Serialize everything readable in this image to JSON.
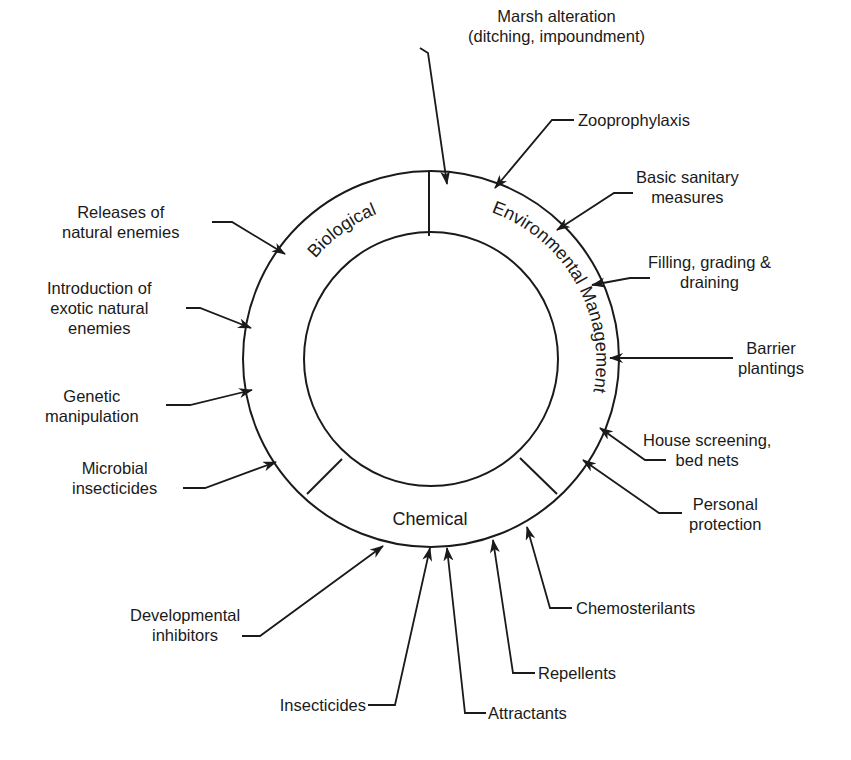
{
  "diagram": {
    "colors": {
      "ink": "#1a1a1a",
      "background": "#ffffff"
    },
    "segments": {
      "biological": "Biological",
      "environmental": "Environmental Management",
      "chemical": "Chemical"
    },
    "labels": {
      "marsh": "Marsh alteration\n(ditching, impoundment)",
      "zoo": "Zooprophylaxis",
      "sanitary": "Basic sanitary\nmeasures",
      "filling": "Filling, grading &\ndraining",
      "barrier": "Barrier\nplantings",
      "house": "House screening,\nbed nets",
      "personal": "Personal\nprotection",
      "chemoster": "Chemosterilants",
      "repellents": "Repellents",
      "attractants": "Attractants",
      "insecticides": "Insecticides",
      "developmental": "Developmental\ninhibitors",
      "microbial": "Microbial\ninsecticides",
      "genetic": "Genetic\nmanipulation",
      "introduction": "Introduction of\nexotic natural\nenemies",
      "releases": "Releases of\nnatural enemies"
    }
  }
}
